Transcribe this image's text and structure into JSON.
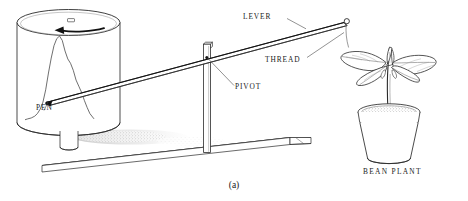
{
  "figure": {
    "caption": "(a)",
    "background_color": "#ffffff",
    "ink_color": "#1a1a1a"
  },
  "labels": {
    "lever": "LEVER",
    "thread": "THREAD",
    "pivot": "PIVOT",
    "pen": "PEN",
    "bean_plant": "BEAN PLANT"
  },
  "parts": {
    "drum": {
      "name": "rotating-recording-drum",
      "rotation_direction": "counterclockwise"
    },
    "trace": {
      "name": "growth-trace-curve",
      "description": "single tall peaked pen trace on drum paper"
    },
    "baseboard": {
      "name": "wooden-baseboard"
    },
    "pot": {
      "name": "flower-pot"
    },
    "plant": {
      "name": "bean-seedling"
    }
  },
  "chart_data": {
    "type": "line",
    "xlabel": "",
    "ylabel": "",
    "x": [
      0,
      4,
      9,
      14,
      18,
      22,
      26,
      30,
      34,
      38,
      42,
      46,
      50,
      54,
      58,
      62,
      66,
      70,
      74,
      78,
      82,
      86,
      90,
      94,
      100
    ],
    "values": [
      2,
      3,
      4,
      6,
      9,
      14,
      22,
      36,
      55,
      72,
      86,
      94,
      97,
      92,
      80,
      71,
      66,
      58,
      47,
      40,
      33,
      24,
      16,
      9,
      3
    ],
    "grid": false,
    "legend": false
  }
}
